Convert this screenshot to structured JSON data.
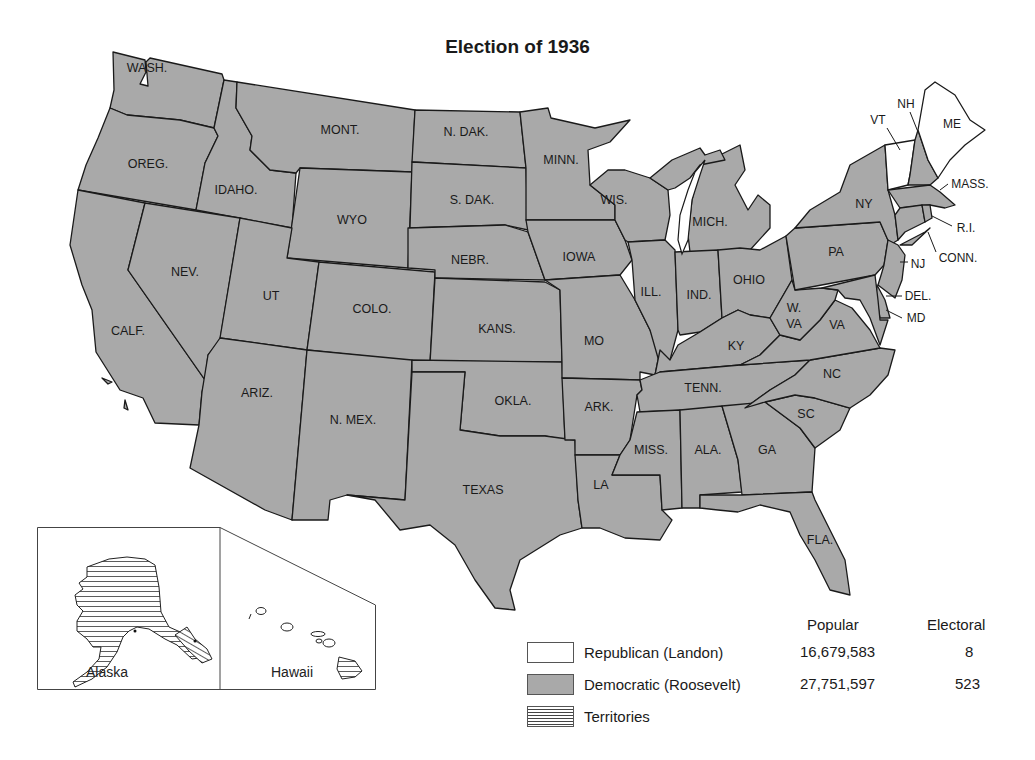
{
  "title": "Election of 1936",
  "colors": {
    "democratic": "#a9a9a9",
    "republican": "#ffffff",
    "outline": "#1a1a1a"
  },
  "states": {
    "wash": "WASH.",
    "oreg": "OREG.",
    "calf": "CALF.",
    "idaho": "IDAHO.",
    "nev": "NEV.",
    "mont": "MONT.",
    "wyo": "WYO",
    "ut": "UT",
    "colo": "COLO.",
    "ariz": "ARIZ.",
    "nmex": "N. MEX.",
    "ndak": "N. DAK.",
    "sdak": "S. DAK.",
    "nebr": "NEBR.",
    "kans": "KANS.",
    "okla": "OKLA.",
    "texas": "TEXAS",
    "minn": "MINN.",
    "iowa": "IOWA",
    "mo": "MO",
    "ark": "ARK.",
    "la": "LA",
    "wis": "WIS.",
    "ill": "ILL.",
    "mich": "MICH.",
    "ind": "IND.",
    "ohio": "OHIO",
    "ky": "KY",
    "tenn": "TENN.",
    "miss": "MISS.",
    "ala": "ALA.",
    "ga": "GA",
    "fla": "FLA.",
    "sc": "SC",
    "nc": "NC",
    "va": "VA",
    "wva1": "W.",
    "wva2": "VA",
    "pa": "PA",
    "ny": "NY",
    "vt": "VT",
    "nh": "NH",
    "me": "ME",
    "mass": "MASS.",
    "ri": "R.I.",
    "conn": "CONN.",
    "nj": "NJ",
    "del": "DEL.",
    "md": "MD"
  },
  "inset": {
    "alaska": "Alaska",
    "hawaii": "Hawaii"
  },
  "legend": {
    "col_popular": "Popular",
    "col_electoral": "Electoral",
    "rows": [
      {
        "label": "Republican (Landon)",
        "popular": "16,679,583",
        "electoral": "8"
      },
      {
        "label": "Democratic (Roosevelt)",
        "popular": "27,751,597",
        "electoral": "523"
      },
      {
        "label": "Territories",
        "popular": "",
        "electoral": ""
      }
    ]
  }
}
